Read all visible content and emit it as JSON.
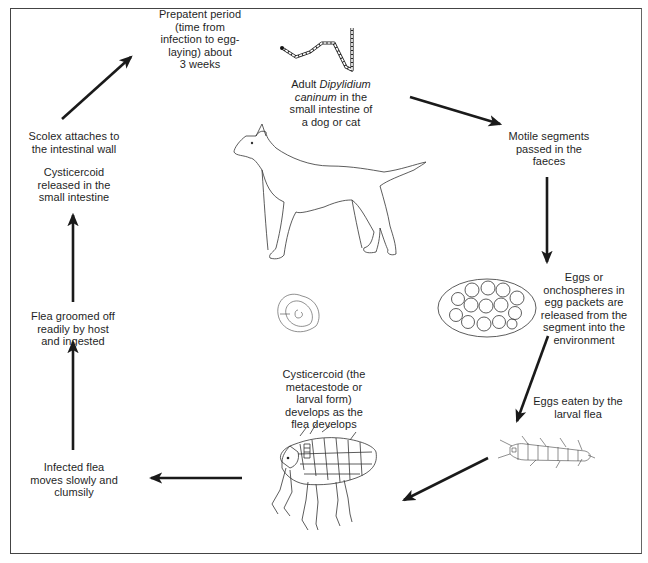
{
  "diagram": {
    "nodes": [
      {
        "id": "adult",
        "lines": [
          "Adult",
          "Dipylidium",
          "caninum",
          "in the",
          "small intestine of",
          "a dog or cat"
        ],
        "line1_prefix": "Adult ",
        "line1_italic": "Dipylidium",
        "line2_italic": "caninum",
        "line2_suffix": " in the",
        "line3": "small intestine of",
        "line4": "a dog or cat"
      },
      {
        "id": "motile",
        "line1": "Motile segments",
        "line2": "passed in the",
        "line3": "faeces"
      },
      {
        "id": "eggs",
        "line1": "Eggs or",
        "line2": "onchospheres in",
        "line3": "egg packets are",
        "line4": "released from the",
        "line5": "segment into the",
        "line6": "environment"
      },
      {
        "id": "eaten",
        "line1": "Eggs eaten by the",
        "line2": "larval flea"
      },
      {
        "id": "cysticercoid",
        "line1": "Cysticercoid (the",
        "line2": "metacestode or",
        "line3": "larval form)",
        "line4": "develops as the",
        "line5": "flea develops"
      },
      {
        "id": "infected",
        "line1": "Infected flea",
        "line2": "moves slowly and",
        "line3": "clumsily"
      },
      {
        "id": "groomed",
        "line1": "Flea groomed off",
        "line2": "readily by host",
        "line3": "and ingested"
      },
      {
        "id": "released",
        "line1": "Cysticercoid",
        "line2": "released in the",
        "line3": "small intestine"
      },
      {
        "id": "scolex",
        "line1": "Scolex attaches to",
        "line2": "the intestinal wall"
      },
      {
        "id": "prepatent",
        "line1": "Prepatent period",
        "line2": "(time from",
        "line3": "infection to egg-",
        "line4": "laying) about",
        "line5": "3 weeks"
      }
    ],
    "illustrations": [
      "tapeworm-icon",
      "dog-icon",
      "egg-packet-icon",
      "flea-larva-icon",
      "flea-icon",
      "cysticercoid-icon"
    ],
    "colors": {
      "line": "#1a1a1a",
      "frame": "#444444",
      "background": "#ffffff"
    }
  }
}
